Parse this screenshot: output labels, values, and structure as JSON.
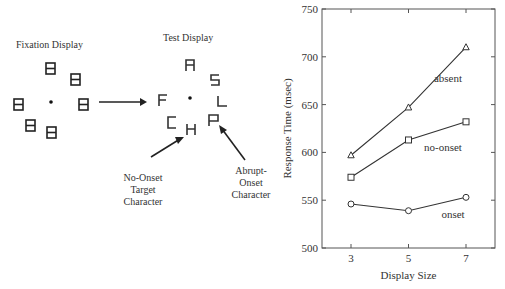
{
  "diagram": {
    "fixation_title": "Fixation Display",
    "test_title": "Test Display",
    "test_letters": [
      "A",
      "S",
      "L",
      "P",
      "H",
      "C",
      "F"
    ],
    "annotation_no_onset": [
      "No-Onset",
      "Target",
      "Character"
    ],
    "annotation_abrupt": [
      "Abrupt-",
      "Onset",
      "Character"
    ]
  },
  "chart_data": {
    "type": "line",
    "title": "",
    "xlabel": "Display Size",
    "ylabel": "Response Time (msec)",
    "x": [
      3,
      5,
      7
    ],
    "ylim": [
      500,
      750
    ],
    "yticks": [
      500,
      550,
      600,
      650,
      700,
      750
    ],
    "xticks": [
      3,
      5,
      7
    ],
    "grid": false,
    "legend_position": "inline labels",
    "series": [
      {
        "name": "absent",
        "marker": "triangle",
        "values": [
          597,
          647,
          710
        ]
      },
      {
        "name": "no-onset",
        "marker": "square",
        "values": [
          574,
          613,
          632
        ]
      },
      {
        "name": "onset",
        "marker": "circle",
        "values": [
          546,
          539,
          553
        ]
      }
    ]
  }
}
